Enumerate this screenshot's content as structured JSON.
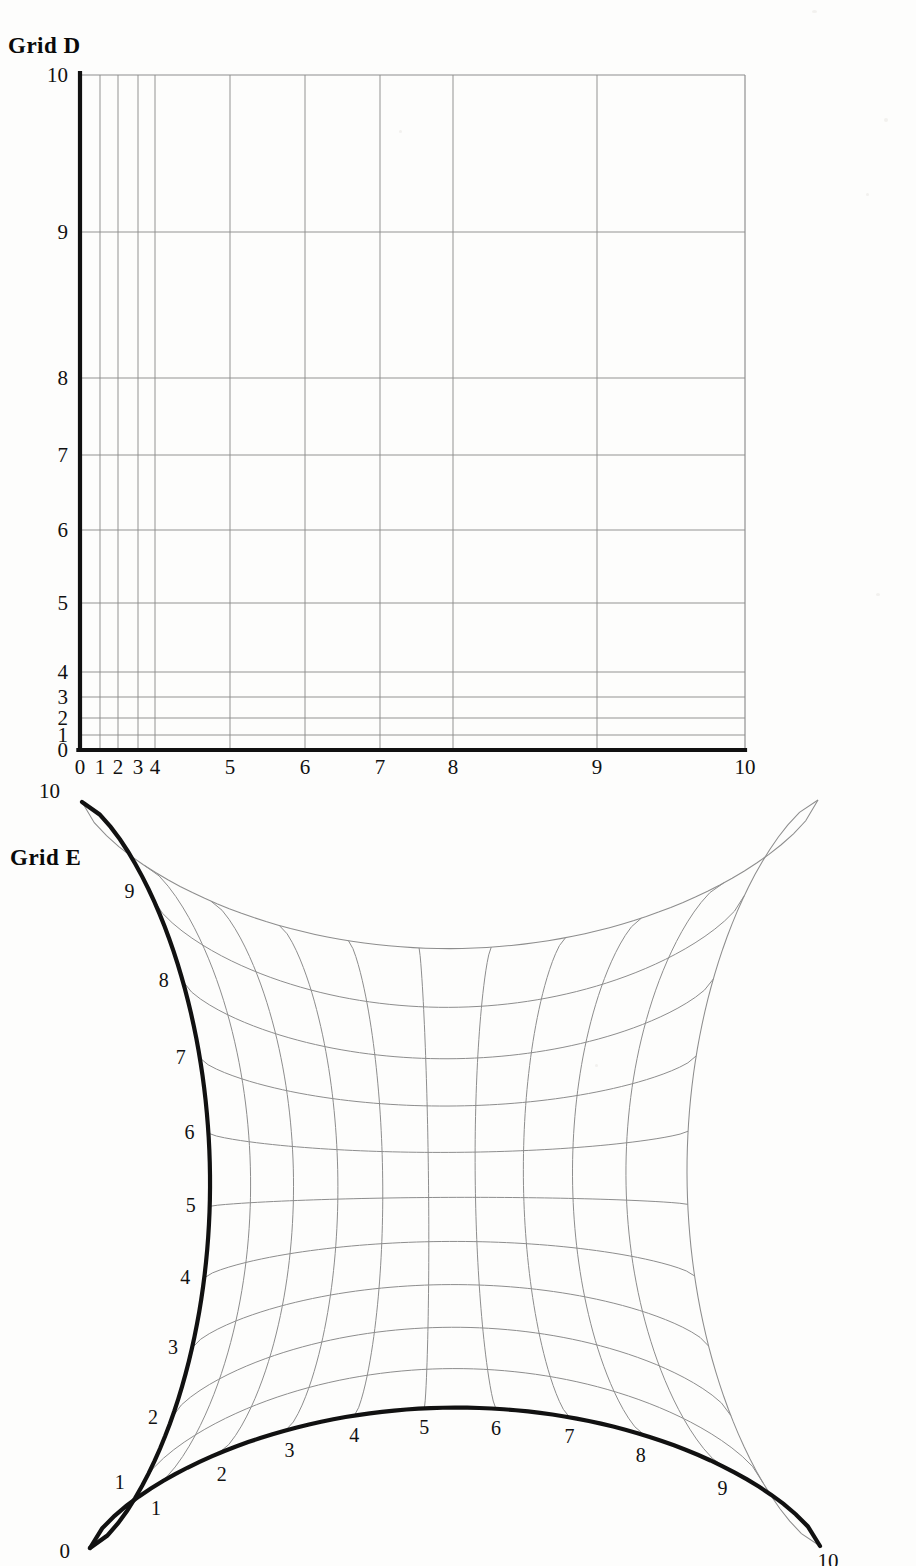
{
  "page": {
    "background": "#fdfdfc",
    "width": 916,
    "height": 1566
  },
  "panels": [
    {
      "id": "grid-d",
      "title": "Grid D",
      "description": "Rectilinear grid with non-uniform (compressed near low x and low y) tick spacing; heavy black left and bottom axes.",
      "axis_color": "#111111",
      "grid_color": "#8d8d8d",
      "x_axis": {
        "labels": [
          "0",
          "1",
          "2",
          "3",
          "4",
          "5",
          "6",
          "7",
          "8",
          "9",
          "10"
        ],
        "values": [
          0,
          1,
          2,
          3,
          4,
          5,
          6,
          7,
          8,
          9,
          10
        ],
        "pixel_positions": [
          80,
          100,
          118,
          138,
          155,
          230,
          305,
          380,
          453,
          597,
          745
        ]
      },
      "y_axis": {
        "labels": [
          "0",
          "1",
          "2",
          "3",
          "4",
          "5",
          "6",
          "7",
          "8",
          "9",
          "10"
        ],
        "values": [
          0,
          1,
          2,
          3,
          4,
          5,
          6,
          7,
          8,
          9,
          10
        ],
        "pixel_positions": [
          750,
          735,
          718,
          697,
          672,
          603,
          530,
          455,
          378,
          232,
          75
        ]
      }
    },
    {
      "id": "grid-e",
      "title": "Grid E",
      "description": "Curvilinear astroid-like grid with four cusped corners; heavy black left and bottom boundary curves, light grey interior coordinate curves.",
      "axis_color": "#111111",
      "grid_color": "#8d8d8d",
      "corners": {
        "origin": [
          90,
          1548
        ],
        "top_left": [
          82,
          802
        ],
        "bottom_right": [
          820,
          1546
        ],
        "top_right": [
          818,
          800
        ]
      },
      "left_axis": {
        "labels": [
          "0",
          "1",
          "2",
          "3",
          "4",
          "5",
          "6",
          "7",
          "8",
          "9",
          "10"
        ],
        "values": [
          0,
          1,
          2,
          3,
          4,
          5,
          6,
          7,
          8,
          9,
          10
        ]
      },
      "bottom_axis": {
        "labels": [
          "0",
          "1",
          "2",
          "3",
          "4",
          "5",
          "6",
          "7",
          "8",
          "9",
          "10"
        ],
        "values": [
          0,
          1,
          2,
          3,
          4,
          5,
          6,
          7,
          8,
          9,
          10
        ]
      }
    }
  ],
  "chart_data": {
    "type": "line",
    "charts": [
      {
        "name": "Grid D",
        "type": "line",
        "xlabel": "",
        "ylabel": "",
        "xlim": [
          0,
          10
        ],
        "ylim": [
          0,
          10
        ],
        "grid": true,
        "legend": "none",
        "x_ticks": [
          0,
          1,
          2,
          3,
          4,
          5,
          6,
          7,
          8,
          9,
          10
        ],
        "y_ticks": [
          0,
          1,
          2,
          3,
          4,
          5,
          6,
          7,
          8,
          9,
          10
        ],
        "x_tick_labels": [
          "0",
          "1",
          "2",
          "3",
          "4",
          "5",
          "6",
          "7",
          "8",
          "9",
          "10"
        ],
        "y_tick_labels": [
          "0",
          "1",
          "2",
          "3",
          "4",
          "5",
          "6",
          "7",
          "8",
          "9",
          "10"
        ],
        "x_normalized_positions": [
          0.0,
          0.03,
          0.057,
          0.087,
          0.113,
          0.226,
          0.338,
          0.451,
          0.561,
          0.777,
          1.0
        ],
        "y_normalized_positions": [
          0.0,
          0.022,
          0.047,
          0.079,
          0.116,
          0.218,
          0.326,
          0.437,
          0.551,
          0.767,
          1.0
        ],
        "annotation": "Spacing compressed toward 0 on both axes; gaps widen toward 10."
      },
      {
        "name": "Grid E",
        "type": "line",
        "xlabel": "",
        "ylabel": "",
        "xlim": [
          0,
          10
        ],
        "ylim": [
          0,
          10
        ],
        "grid": true,
        "legend": "none",
        "x_ticks": [
          0,
          1,
          2,
          3,
          4,
          5,
          6,
          7,
          8,
          9,
          10
        ],
        "y_ticks": [
          0,
          1,
          2,
          3,
          4,
          5,
          6,
          7,
          8,
          9,
          10
        ],
        "x_tick_labels": [
          "0",
          "1",
          "2",
          "3",
          "4",
          "5",
          "6",
          "7",
          "8",
          "9",
          "10"
        ],
        "y_tick_labels": [
          "0",
          "1",
          "2",
          "3",
          "4",
          "5",
          "6",
          "7",
          "8",
          "9",
          "10"
        ],
        "annotation": "Square domain mapped by a curvilinear transform: all four boundaries bow inward, meeting in cusps at the four corners."
      }
    ]
  }
}
